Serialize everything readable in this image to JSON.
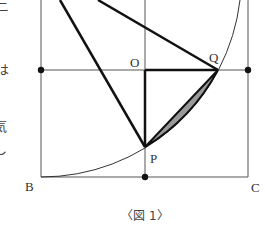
{
  "figure": {
    "caption": "〈図 1〉",
    "points": {
      "O": "O",
      "Q": "Q",
      "P": "P",
      "B": "B",
      "C": "C"
    },
    "side_text_fragments": [
      "ニ",
      "は",
      "気",
      "し"
    ],
    "colors": {
      "line": "#111111",
      "thin_line": "#555555",
      "shaded_region": "#999999",
      "background": "#ffffff"
    }
  }
}
